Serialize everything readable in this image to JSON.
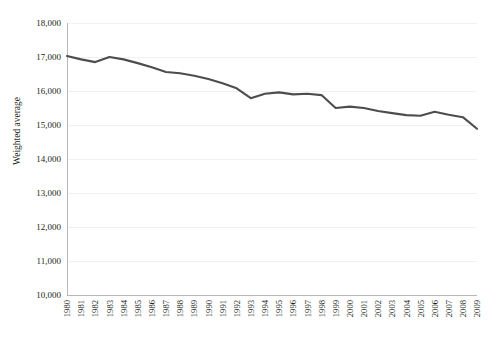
{
  "chart_data": {
    "type": "line",
    "title": "",
    "subtitle": "",
    "xlabel": "",
    "ylabel": "Weighted average",
    "x": [
      1980,
      1981,
      1982,
      1983,
      1984,
      1985,
      1986,
      1987,
      1988,
      1989,
      1990,
      1991,
      1992,
      1993,
      1994,
      1995,
      1996,
      1997,
      1998,
      1999,
      2000,
      2001,
      2002,
      2003,
      2004,
      2005,
      2006,
      2007,
      2008,
      2009
    ],
    "categories": [
      "1980",
      "1981",
      "1982",
      "1983",
      "1984",
      "1985",
      "1986",
      "1987",
      "1988",
      "1989",
      "1990",
      "1991",
      "1992",
      "1993",
      "1994",
      "1995",
      "1996",
      "1997",
      "1998",
      "1999",
      "2000",
      "2001",
      "2002",
      "2003",
      "2004",
      "2005",
      "2006",
      "2007",
      "2008",
      "2009"
    ],
    "series": [
      {
        "name": "Weighted average",
        "color": "#4d4d4d",
        "values": [
          17030,
          16930,
          16850,
          17000,
          16930,
          16820,
          16700,
          16560,
          16520,
          16450,
          16350,
          16230,
          16080,
          15790,
          15920,
          15960,
          15900,
          15920,
          15880,
          15500,
          15540,
          15500,
          15410,
          15350,
          15290,
          15270,
          15390,
          15300,
          15230,
          14890
        ]
      }
    ],
    "ylim": [
      10000,
      18000
    ],
    "yticks": [
      10000,
      11000,
      12000,
      13000,
      14000,
      15000,
      16000,
      17000,
      18000
    ],
    "ytick_labels": [
      "10,000",
      "11,000",
      "12,000",
      "13,000",
      "14,000",
      "15,000",
      "16,000",
      "17,000",
      "18,000"
    ],
    "xlim": [
      1980,
      2009
    ],
    "grid": "horizontal",
    "legend": "none",
    "annotations": []
  },
  "colors": {
    "line": "#4d4d4d",
    "grid": "#f1f1f1",
    "axis": "#b8b8b8",
    "text": "#231f20",
    "background": "#ffffff"
  }
}
